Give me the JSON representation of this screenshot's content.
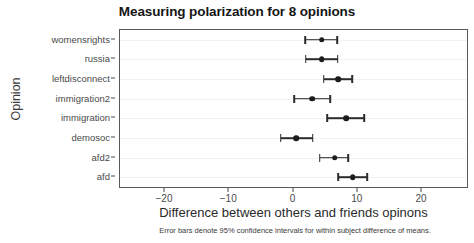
{
  "chart_data": {
    "type": "scatter",
    "title": "Measuring polarization for 8 opinions",
    "subtitle": "",
    "caption": "Error bars denote 95% confidence intervals for within subject difference of means.",
    "xlabel": "Difference between others and friends opinons",
    "ylabel": "Opinion",
    "orientation": "horizontal",
    "grid": "light horizontal gridlines only",
    "legend": "none",
    "xlim": [
      -27,
      27
    ],
    "xticks": [
      -20,
      -10,
      0,
      10,
      20
    ],
    "xticklabels": [
      "−20",
      "−10",
      "0",
      "10",
      "20"
    ],
    "categories": [
      "womensrights",
      "russia",
      "leftdisconnect",
      "immigration2",
      "immigration",
      "demosoc",
      "afd2",
      "afd"
    ],
    "series": [
      {
        "name": "Difference between others and friends opinions",
        "marker": "filled circle with horizontal error bars",
        "points": [
          {
            "category": "womensrights",
            "value": 4.4,
            "ci_low": 1.8,
            "ci_high": 6.8
          },
          {
            "category": "russia",
            "value": 4.4,
            "ci_low": 1.9,
            "ci_high": 6.9
          },
          {
            "category": "leftdisconnect",
            "value": 7.0,
            "ci_low": 4.7,
            "ci_high": 9.1
          },
          {
            "category": "immigration2",
            "value": 2.9,
            "ci_low": 0.1,
            "ci_high": 5.7
          },
          {
            "category": "immigration",
            "value": 8.2,
            "ci_low": 5.2,
            "ci_high": 11.0
          },
          {
            "category": "demosoc",
            "value": 0.4,
            "ci_low": -2.0,
            "ci_high": 3.0
          },
          {
            "category": "afd2",
            "value": 6.4,
            "ci_low": 4.1,
            "ci_high": 8.5
          },
          {
            "category": "afd",
            "value": 9.2,
            "ci_low": 7.0,
            "ci_high": 11.5
          }
        ]
      }
    ],
    "colors": {
      "point": "#1c1c1c",
      "errorbar": "#2b2b2b",
      "panel_border": "#5a5a5a",
      "gridline": "#f2f2f2",
      "background": "#ffffff",
      "text": "#1a1a1a"
    }
  }
}
